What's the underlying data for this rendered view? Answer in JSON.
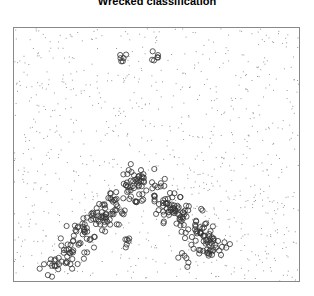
{
  "title": "Wrecked classification",
  "chart_data": {
    "type": "scatter",
    "title": "Wrecked classification",
    "xlabel": "",
    "ylabel": "",
    "grid": false,
    "axes_ticks": false,
    "xlim": [
      0,
      1
    ],
    "ylim": [
      0,
      1
    ],
    "series": [
      {
        "name": "background",
        "marker": "tiny-dot",
        "color": "#999999",
        "distribution": "uniform",
        "count": 900
      },
      {
        "name": "class",
        "marker": "hollow-circle",
        "color": "#333333",
        "shape": "inverted-V",
        "peak": [
          0.44,
          0.4
        ],
        "left_end": [
          0.12,
          0.05
        ],
        "right_end": [
          0.72,
          0.12
        ],
        "count": 320,
        "small_clusters": [
          [
            0.38,
            0.88
          ],
          [
            0.5,
            0.88
          ],
          [
            0.4,
            0.15
          ],
          [
            0.6,
            0.09
          ]
        ]
      }
    ]
  }
}
